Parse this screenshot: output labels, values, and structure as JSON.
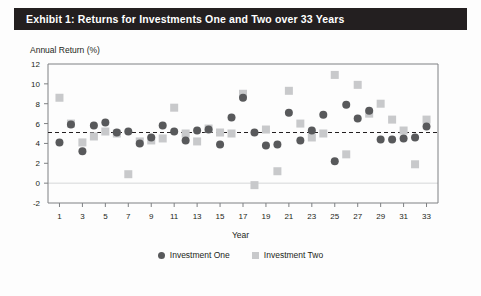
{
  "exhibit": {
    "title": "Exhibit 1: Returns for Investments One and Two over 33 Years"
  },
  "legend": {
    "series_one_label": "Investment One",
    "series_two_label": "Investment Two",
    "marker_one": "filled-circle",
    "marker_two": "filled-square"
  },
  "colors": {
    "title_bar": "#231f20",
    "title_text": "#ffffff",
    "series_one": "#58595b",
    "series_two": "#c8c9cb",
    "axis": "#7e8083",
    "mean_line": "#231f20",
    "zero_line": "#d6d7d9",
    "background": "#fdfdfd"
  },
  "chart_data": {
    "type": "scatter",
    "title": "Annual Return (%)",
    "xlabel": "Year",
    "ylabel": "Annual Return (%)",
    "xlim": [
      0,
      34
    ],
    "ylim": [
      -2,
      12
    ],
    "ytick_step": 2,
    "yticks": [
      -2,
      0,
      2,
      4,
      6,
      8,
      10,
      12
    ],
    "xticks": [
      1,
      3,
      5,
      7,
      9,
      11,
      13,
      15,
      17,
      19,
      21,
      23,
      25,
      27,
      29,
      31,
      33
    ],
    "grid": false,
    "legend_position": "bottom-center",
    "annotations": [
      {
        "type": "hline",
        "value": 5.1,
        "style": "dashed",
        "label": "mean return"
      },
      {
        "type": "hline",
        "value": 0,
        "style": "solid",
        "label": "zero"
      }
    ],
    "x": [
      1,
      2,
      3,
      4,
      5,
      6,
      7,
      8,
      9,
      10,
      11,
      12,
      13,
      14,
      15,
      16,
      17,
      18,
      19,
      20,
      21,
      22,
      23,
      24,
      25,
      26,
      27,
      28,
      29,
      30,
      31,
      32,
      33
    ],
    "series": [
      {
        "name": "Investment One",
        "marker": "circle",
        "color": "#58595b",
        "values": [
          4.1,
          5.9,
          3.2,
          5.8,
          6.1,
          5.1,
          5.2,
          4.0,
          4.6,
          5.8,
          5.2,
          4.3,
          5.3,
          5.4,
          3.9,
          6.6,
          8.6,
          5.1,
          3.8,
          3.9,
          7.1,
          4.3,
          5.3,
          6.9,
          2.2,
          7.9,
          6.5,
          7.3,
          4.4,
          4.4,
          4.5,
          4.6,
          5.7
        ]
      },
      {
        "name": "Investment Two",
        "marker": "square",
        "color": "#c8c9cb",
        "values": [
          8.6,
          6.0,
          4.1,
          4.7,
          5.2,
          5.0,
          0.9,
          4.2,
          4.3,
          4.5,
          7.6,
          5.0,
          4.2,
          5.5,
          5.1,
          5.0,
          9.0,
          -0.2,
          5.4,
          1.2,
          9.3,
          6.0,
          4.6,
          5.0,
          10.9,
          2.9,
          9.9,
          7.0,
          8.0,
          6.4,
          5.3,
          1.9,
          6.4
        ]
      }
    ]
  }
}
